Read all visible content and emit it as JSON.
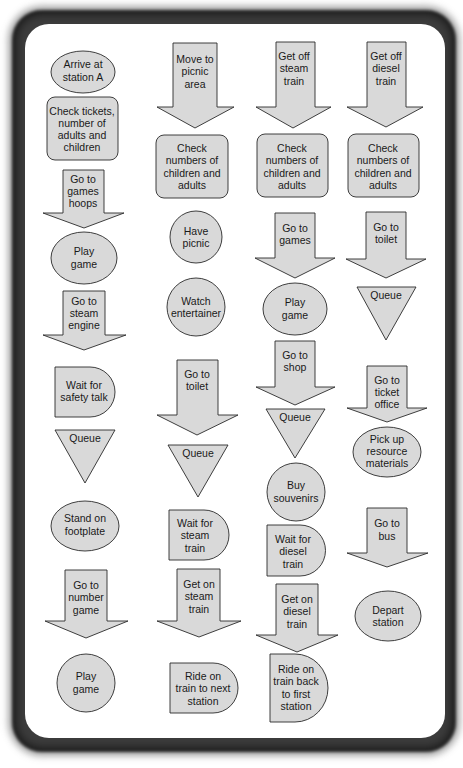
{
  "diagram": {
    "type": "process-sequence",
    "style": {
      "shape_fill": "#d9d9d9",
      "shape_stroke": "#2a2a2a",
      "frame_color": "#3c3c3c",
      "background": "#ffffff"
    },
    "columns": [
      {
        "id": "col1",
        "steps": [
          {
            "shape": "ellipse",
            "lines": [
              "Arrive at",
              "station A"
            ]
          },
          {
            "shape": "rounded-rect",
            "lines": [
              "Check tickets,",
              "number of",
              "adults and",
              "children"
            ]
          },
          {
            "shape": "arrow",
            "lines": [
              "Go to",
              "games",
              "hoops"
            ]
          },
          {
            "shape": "ellipse",
            "lines": [
              "Play",
              "game"
            ]
          },
          {
            "shape": "arrow",
            "lines": [
              "Go to",
              "steam",
              "engine"
            ]
          },
          {
            "shape": "delay",
            "lines": [
              "Wait for",
              "safety talk"
            ]
          },
          {
            "shape": "triangle",
            "lines": [
              "Queue"
            ]
          },
          {
            "shape": "ellipse",
            "lines": [
              "Stand on",
              "footplate"
            ]
          },
          {
            "shape": "arrow",
            "lines": [
              "Go to",
              "number",
              "game"
            ]
          },
          {
            "shape": "circle",
            "lines": [
              "Play",
              "game"
            ]
          }
        ]
      },
      {
        "id": "col2",
        "steps": [
          {
            "shape": "arrow",
            "lines": [
              "Move to",
              "picnic",
              "area"
            ]
          },
          {
            "shape": "rounded-rect",
            "lines": [
              "Check",
              "numbers of",
              "children and",
              "adults"
            ]
          },
          {
            "shape": "circle",
            "lines": [
              "Have",
              "picnic"
            ]
          },
          {
            "shape": "circle",
            "lines": [
              "Watch",
              "entertainer"
            ]
          },
          {
            "shape": "arrow",
            "lines": [
              "Go to",
              "toilet"
            ]
          },
          {
            "shape": "triangle",
            "lines": [
              "Queue"
            ]
          },
          {
            "shape": "delay",
            "lines": [
              "Wait for",
              "steam",
              "train"
            ]
          },
          {
            "shape": "arrow",
            "lines": [
              "Get on",
              "steam",
              "train"
            ]
          },
          {
            "shape": "delay",
            "lines": [
              "Ride on",
              "train to next",
              "station"
            ]
          }
        ]
      },
      {
        "id": "col3",
        "steps": [
          {
            "shape": "arrow",
            "lines": [
              "Get off",
              "steam",
              "train"
            ]
          },
          {
            "shape": "rounded-rect",
            "lines": [
              "Check",
              "numbers of",
              "children and",
              "adults"
            ]
          },
          {
            "shape": "arrow",
            "lines": [
              "Go to",
              "games"
            ]
          },
          {
            "shape": "ellipse",
            "lines": [
              "Play",
              "game"
            ]
          },
          {
            "shape": "arrow",
            "lines": [
              "Go to",
              "shop"
            ]
          },
          {
            "shape": "triangle",
            "lines": [
              "Queue"
            ]
          },
          {
            "shape": "circle",
            "lines": [
              "Buy",
              "souvenirs"
            ]
          },
          {
            "shape": "delay",
            "lines": [
              "Wait for",
              "diesel",
              "train"
            ]
          },
          {
            "shape": "arrow",
            "lines": [
              "Get on",
              "diesel",
              "train"
            ]
          },
          {
            "shape": "delay",
            "lines": [
              "Ride on",
              "train back",
              "to first",
              "station"
            ]
          }
        ]
      },
      {
        "id": "col4",
        "steps": [
          {
            "shape": "arrow",
            "lines": [
              "Get off",
              "diesel",
              "train"
            ]
          },
          {
            "shape": "rounded-rect",
            "lines": [
              "Check",
              "numbers of",
              "children and",
              "adults"
            ]
          },
          {
            "shape": "arrow",
            "lines": [
              "Go to",
              "toilet"
            ]
          },
          {
            "shape": "triangle",
            "lines": [
              "Queue"
            ]
          },
          {
            "shape": "arrow",
            "lines": [
              "Go to",
              "ticket",
              "office"
            ]
          },
          {
            "shape": "ellipse",
            "lines": [
              "Pick up",
              "resource",
              "materials"
            ]
          },
          {
            "shape": "arrow",
            "lines": [
              "Go to",
              "bus"
            ]
          },
          {
            "shape": "ellipse",
            "lines": [
              "Depart",
              "station"
            ]
          }
        ]
      }
    ]
  }
}
